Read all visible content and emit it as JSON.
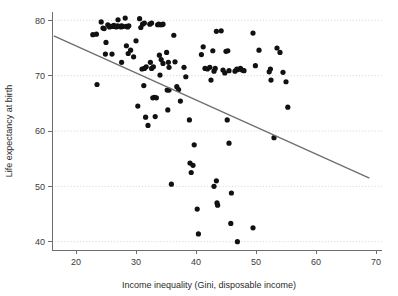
{
  "chart_data": {
    "type": "scatter",
    "title": "",
    "xlabel": "Income inequality (Gini, disposable income)",
    "ylabel": "Life expectancy at birth",
    "xlim": [
      16,
      71
    ],
    "ylim": [
      38.5,
      81.5
    ],
    "xticks": [
      20,
      30,
      40,
      50,
      60,
      70
    ],
    "yticks": [
      40,
      50,
      60,
      70,
      80
    ],
    "xtick_labels": [
      "20",
      "30",
      "40",
      "50",
      "60",
      "70"
    ],
    "ytick_labels": [
      "40",
      "50",
      "60",
      "70",
      "80"
    ],
    "grid": "horizontal-dotted",
    "legend": "none",
    "point_color": "#111111",
    "fit_line_color": "#6f6f6f",
    "grid_color": "#cfcfcf",
    "axis_color": "#6d6d6d",
    "fit_line": {
      "type": "linear",
      "x_start": 16.3,
      "y_start": 77.2,
      "x_end": 68.9,
      "y_end": 51.5
    },
    "points": [
      [
        22.8,
        77.4
      ],
      [
        23.4,
        77.5
      ],
      [
        23.5,
        68.4
      ],
      [
        24.2,
        79.7
      ],
      [
        24.5,
        78.6
      ],
      [
        24.7,
        78.5
      ],
      [
        25.0,
        76.0
      ],
      [
        25.3,
        79.2
      ],
      [
        25.6,
        78.8
      ],
      [
        25.8,
        78.9
      ],
      [
        26.1,
        78.9
      ],
      [
        26.3,
        79.1
      ],
      [
        26.5,
        78.9
      ],
      [
        26.7,
        78.8
      ],
      [
        26.9,
        79.0
      ],
      [
        27.0,
        80.1
      ],
      [
        27.3,
        78.9
      ],
      [
        27.5,
        78.8
      ],
      [
        27.6,
        79.0
      ],
      [
        27.8,
        78.9
      ],
      [
        24.9,
        73.9
      ],
      [
        26.0,
        73.9
      ],
      [
        27.6,
        72.4
      ],
      [
        28.2,
        80.4
      ],
      [
        28.4,
        78.9
      ],
      [
        28.6,
        78.8
      ],
      [
        28.8,
        79.0
      ],
      [
        28.4,
        75.4
      ],
      [
        28.7,
        74.0
      ],
      [
        29.1,
        74.6
      ],
      [
        29.6,
        73.4
      ],
      [
        30.0,
        76.3
      ],
      [
        30.3,
        64.5
      ],
      [
        30.6,
        80.3
      ],
      [
        30.8,
        78.7
      ],
      [
        31.1,
        79.3
      ],
      [
        31.4,
        79.5
      ],
      [
        31.0,
        71.2
      ],
      [
        31.4,
        71.3
      ],
      [
        31.7,
        71.6
      ],
      [
        31.3,
        68.2
      ],
      [
        31.6,
        62.5
      ],
      [
        32.0,
        61.0
      ],
      [
        32.3,
        79.3
      ],
      [
        32.6,
        79.5
      ],
      [
        32.4,
        72.4
      ],
      [
        32.6,
        71.3
      ],
      [
        32.9,
        71.6
      ],
      [
        32.8,
        66.0
      ],
      [
        33.1,
        66.1
      ],
      [
        33.4,
        66.0
      ],
      [
        33.2,
        62.6
      ],
      [
        33.6,
        79.2
      ],
      [
        33.8,
        79.3
      ],
      [
        34.0,
        79.2
      ],
      [
        34.3,
        79.2
      ],
      [
        34.5,
        79.3
      ],
      [
        33.9,
        73.7
      ],
      [
        34.2,
        72.9
      ],
      [
        34.5,
        72.2
      ],
      [
        34.0,
        70.1
      ],
      [
        35.1,
        74.2
      ],
      [
        35.4,
        72.4
      ],
      [
        35.5,
        71.5
      ],
      [
        35.2,
        67.4
      ],
      [
        35.5,
        67.4
      ],
      [
        35.3,
        63.8
      ],
      [
        35.9,
        50.4
      ],
      [
        36.3,
        77.3
      ],
      [
        36.5,
        72.5
      ],
      [
        36.8,
        68.0
      ],
      [
        37.1,
        67.5
      ],
      [
        37.4,
        65.4
      ],
      [
        38.0,
        71.5
      ],
      [
        38.3,
        69.8
      ],
      [
        38.9,
        62.0
      ],
      [
        39.0,
        54.2
      ],
      [
        39.2,
        52.5
      ],
      [
        39.5,
        53.8
      ],
      [
        39.7,
        57.5
      ],
      [
        40.2,
        45.9
      ],
      [
        40.4,
        41.4
      ],
      [
        40.9,
        73.8
      ],
      [
        41.2,
        75.2
      ],
      [
        41.5,
        71.3
      ],
      [
        41.9,
        71.2
      ],
      [
        42.3,
        71.5
      ],
      [
        42.5,
        69.2
      ],
      [
        42.8,
        74.5
      ],
      [
        43.0,
        70.8
      ],
      [
        43.2,
        71.3
      ],
      [
        43.4,
        78.0
      ],
      [
        43.0,
        50.0
      ],
      [
        43.4,
        51.0
      ],
      [
        43.5,
        47.0
      ],
      [
        43.6,
        46.6
      ],
      [
        44.2,
        78.1
      ],
      [
        44.5,
        71.0
      ],
      [
        44.8,
        70.5
      ],
      [
        45.0,
        74.4
      ],
      [
        45.3,
        74.5
      ],
      [
        45.5,
        70.9
      ],
      [
        45.2,
        62.0
      ],
      [
        45.5,
        57.8
      ],
      [
        45.9,
        48.8
      ],
      [
        45.8,
        43.3
      ],
      [
        46.5,
        70.8
      ],
      [
        46.8,
        71.2
      ],
      [
        47.0,
        71.1
      ],
      [
        46.9,
        40.0
      ],
      [
        47.4,
        71.3
      ],
      [
        47.7,
        71.0
      ],
      [
        48.0,
        70.9
      ],
      [
        49.5,
        77.7
      ],
      [
        49.5,
        42.5
      ],
      [
        49.9,
        71.8
      ],
      [
        50.5,
        74.6
      ],
      [
        52.2,
        70.7
      ],
      [
        52.4,
        71.2
      ],
      [
        52.5,
        69.2
      ],
      [
        53.0,
        58.8
      ],
      [
        53.5,
        75.0
      ],
      [
        54.0,
        74.2
      ],
      [
        54.5,
        70.6
      ],
      [
        55.0,
        68.9
      ],
      [
        55.3,
        64.3
      ]
    ]
  }
}
